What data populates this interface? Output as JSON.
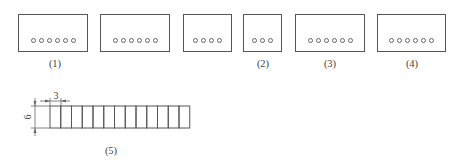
{
  "figure": {
    "boxes": [
      {
        "id": "box-1",
        "left": 18,
        "top": 14,
        "width": 70,
        "height": 38,
        "holes": 6
      },
      {
        "id": "box-2",
        "left": 100,
        "top": 14,
        "width": 70,
        "height": 38,
        "holes": 6
      },
      {
        "id": "box-3",
        "left": 183,
        "top": 14,
        "width": 49,
        "height": 38,
        "holes": 4
      },
      {
        "id": "box-4",
        "left": 243,
        "top": 14,
        "width": 39,
        "height": 38,
        "holes": 3
      },
      {
        "id": "box-5",
        "left": 295,
        "top": 14,
        "width": 70,
        "height": 38,
        "holes": 6
      },
      {
        "id": "box-6",
        "left": 377,
        "top": 14,
        "width": 69,
        "height": 38,
        "holes": 6
      }
    ],
    "labels": [
      {
        "text": "(1)",
        "x": 55,
        "y": 58
      },
      {
        "text": "(2)",
        "x": 263,
        "y": 58
      },
      {
        "text": "(3)",
        "x": 330,
        "y": 58
      },
      {
        "text": "(4)",
        "x": 412,
        "y": 58
      },
      {
        "text": "(5)",
        "x": 111,
        "y": 145
      }
    ],
    "strip": {
      "left": 50,
      "top": 106,
      "cell_width": 10.75,
      "height": 22,
      "cells": 13,
      "dimension_width": "3",
      "dimension_height": "6"
    }
  }
}
